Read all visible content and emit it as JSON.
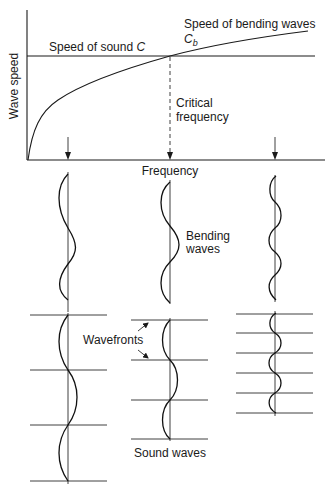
{
  "diagram": {
    "axes": {
      "y_label": "Wave speed",
      "x_label": "Frequency"
    },
    "labels": {
      "sound_speed": "Speed of sound ",
      "sound_speed_symbol": "C",
      "bending_speed": "Speed of bending waves",
      "bending_symbol": "C",
      "bending_subscript": "b",
      "critical_line1": "Critical",
      "critical_line2": "frequency",
      "bending_waves_line1": "Bending",
      "bending_waves_line2": "waves",
      "wavefronts": "Wavefronts",
      "sound_waves": "Sound waves"
    },
    "columns": [
      {
        "name": "below-critical",
        "bending_cycles": 1.5,
        "wavefront_count": 4
      },
      {
        "name": "at-critical",
        "bending_cycles": 1.5,
        "wavefront_count": 4
      },
      {
        "name": "above-critical",
        "bending_cycles": 2.5,
        "wavefront_count": 6
      }
    ],
    "colors": {
      "ink": "#1a1a1a",
      "background": "#ffffff"
    }
  }
}
